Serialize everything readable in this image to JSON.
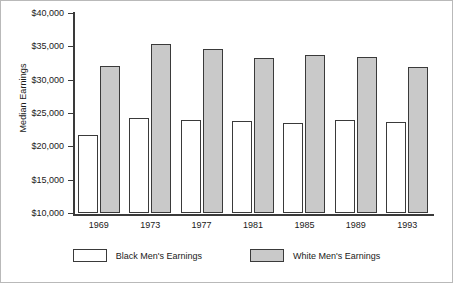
{
  "chart_data": {
    "type": "bar",
    "title": "",
    "xlabel": "",
    "ylabel": "Median Earnings",
    "categories": [
      "1969",
      "1973",
      "1977",
      "1981",
      "1985",
      "1989",
      "1993"
    ],
    "series": [
      {
        "name": "Black Men's Earnings",
        "color": "#ffffff",
        "values": [
          21700,
          24300,
          23900,
          23800,
          23500,
          23900,
          23600
        ]
      },
      {
        "name": "White Men's Earnings",
        "color": "#c9c9c9",
        "values": [
          32100,
          35300,
          34600,
          33300,
          33700,
          33400,
          31900
        ]
      }
    ],
    "ylim": [
      10000,
      40000
    ],
    "ytick_values": [
      40000,
      35000,
      30000,
      25000,
      20000,
      15000,
      10000
    ],
    "ytick_labels": [
      "$40,000",
      "$35,000",
      "$30,000",
      "$25,000",
      "$20,000",
      "$15,000",
      "$10,000"
    ],
    "grid": false,
    "legend_position": "bottom",
    "bar_edge_color": "#3a3a3a",
    "axis_color": "#3a3a3a"
  }
}
